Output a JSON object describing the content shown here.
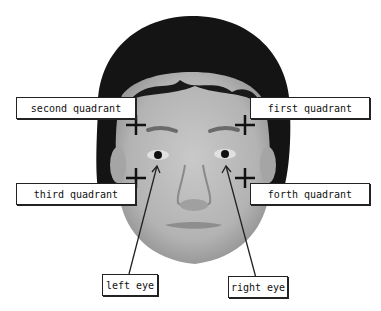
{
  "figure": {
    "labels": {
      "second_quadrant": "second quadrant",
      "first_quadrant": "first quadrant",
      "third_quadrant": "third quadrant",
      "forth_quadrant": "forth quadrant",
      "left_eye": "left eye",
      "right_eye": "right eye"
    },
    "markers": [
      {
        "name": "second-quadrant-cross",
        "x": 136,
        "y": 125
      },
      {
        "name": "first-quadrant-cross",
        "x": 245,
        "y": 125
      },
      {
        "name": "third-quadrant-cross",
        "x": 136,
        "y": 178
      },
      {
        "name": "forth-quadrant-cross",
        "x": 245,
        "y": 178
      }
    ],
    "colors": {
      "hair": "#111111",
      "skin": "#b8b8b8",
      "line": "#222222"
    }
  }
}
